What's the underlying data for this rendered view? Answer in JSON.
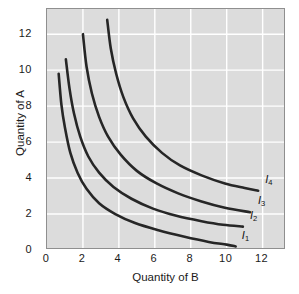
{
  "chart_data": {
    "type": "line",
    "title": "",
    "subtitle": "",
    "xlabel": "Quantity of B",
    "ylabel": "Quantity of A",
    "xlim": [
      0,
      13.3
    ],
    "ylim": [
      0,
      13.4
    ],
    "xticks": [
      "0",
      "2",
      "4",
      "6",
      "8",
      "10",
      "12"
    ],
    "xtick_values": [
      0,
      2,
      4,
      6,
      8,
      10,
      12
    ],
    "yticks": [
      "0",
      "2",
      "4",
      "6",
      "8",
      "10",
      "12"
    ],
    "ytick_values": [
      0,
      2,
      4,
      6,
      8,
      10,
      12
    ],
    "grid": true,
    "grid_color": "#ffffff",
    "plot_background": "#dcdcdc",
    "figure_background": "#ffffff",
    "curve_color": "#262626",
    "legend_position": "inline-right-end",
    "annotations": [
      {
        "text": "I",
        "sub": "1",
        "x": 10.9,
        "y": 0.75
      },
      {
        "text": "I",
        "sub": "2",
        "x": 11.35,
        "y": 1.85
      },
      {
        "text": "I",
        "sub": "3",
        "x": 11.8,
        "y": 2.65
      },
      {
        "text": "I",
        "sub": "4",
        "x": 12.2,
        "y": 3.85
      }
    ],
    "series": [
      {
        "name": "I1",
        "label": "I",
        "sublabel": "1",
        "points": [
          [
            0.65,
            9.8
          ],
          [
            0.8,
            8.1
          ],
          [
            1.0,
            6.8
          ],
          [
            1.3,
            5.4
          ],
          [
            1.7,
            4.3
          ],
          [
            2.2,
            3.4
          ],
          [
            2.9,
            2.6
          ],
          [
            3.8,
            2.0
          ],
          [
            4.9,
            1.5
          ],
          [
            6.2,
            1.1
          ],
          [
            7.6,
            0.75
          ],
          [
            9.0,
            0.45
          ],
          [
            10.0,
            0.3
          ],
          [
            10.5,
            0.2
          ]
        ]
      },
      {
        "name": "I2",
        "label": "I",
        "sublabel": "2",
        "points": [
          [
            1.05,
            10.6
          ],
          [
            1.25,
            9.0
          ],
          [
            1.5,
            7.6
          ],
          [
            1.85,
            6.3
          ],
          [
            2.3,
            5.2
          ],
          [
            2.9,
            4.3
          ],
          [
            3.7,
            3.5
          ],
          [
            4.7,
            2.85
          ],
          [
            5.9,
            2.3
          ],
          [
            7.2,
            1.9
          ],
          [
            8.6,
            1.6
          ],
          [
            9.8,
            1.4
          ],
          [
            10.9,
            1.3
          ]
        ]
      },
      {
        "name": "I3",
        "label": "I",
        "sublabel": "3",
        "points": [
          [
            2.0,
            12.0
          ],
          [
            2.2,
            10.2
          ],
          [
            2.5,
            8.7
          ],
          [
            2.9,
            7.4
          ],
          [
            3.4,
            6.3
          ],
          [
            4.1,
            5.3
          ],
          [
            5.0,
            4.4
          ],
          [
            6.1,
            3.7
          ],
          [
            7.3,
            3.15
          ],
          [
            8.6,
            2.7
          ],
          [
            9.9,
            2.35
          ],
          [
            11.3,
            2.1
          ]
        ]
      },
      {
        "name": "I4",
        "label": "I",
        "sublabel": "4",
        "points": [
          [
            3.35,
            12.8
          ],
          [
            3.55,
            11.2
          ],
          [
            3.85,
            9.8
          ],
          [
            4.25,
            8.5
          ],
          [
            4.8,
            7.3
          ],
          [
            5.5,
            6.3
          ],
          [
            6.4,
            5.4
          ],
          [
            7.4,
            4.7
          ],
          [
            8.6,
            4.15
          ],
          [
            9.9,
            3.7
          ],
          [
            11.0,
            3.45
          ],
          [
            11.75,
            3.3
          ]
        ]
      }
    ]
  },
  "axes": {
    "x_title": "Quantity of B",
    "y_title": "Quantity of A"
  }
}
